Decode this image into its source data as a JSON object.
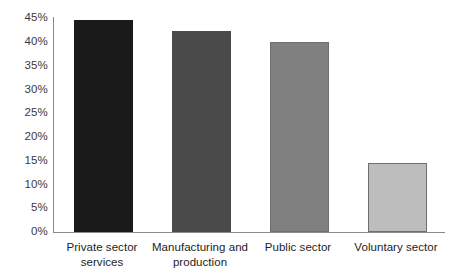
{
  "chart_data": {
    "type": "bar",
    "title": "",
    "subtitle": "",
    "xlabel": "",
    "ylabel": "",
    "ylim": [
      0,
      45
    ],
    "grid": false,
    "legend": "none",
    "categories": [
      "Private sector services",
      "Manufacturing and production",
      "Public sector",
      "Voluntary sector"
    ],
    "category_lines": [
      [
        "Private sector",
        "services"
      ],
      [
        "Manufacturing and",
        "production"
      ],
      [
        "Public sector"
      ],
      [
        "Voluntary sector"
      ]
    ],
    "values": [
      44.7,
      42.3,
      40.0,
      14.5
    ],
    "value_labels": [
      "44.7%",
      "42.3%",
      "40.0%",
      "14.5%"
    ],
    "bar_colors": [
      "#1a1a1a",
      "#4a4a4a",
      "#808080",
      "#bdbdbd"
    ],
    "bar_border_colors": [
      "#1a1a1a",
      "#4a4a4a",
      "#6f6f6f",
      "#6f6f6f"
    ],
    "y_ticks": [
      0,
      5,
      10,
      15,
      20,
      25,
      30,
      35,
      40,
      45
    ],
    "y_tick_labels": [
      "0%",
      "5%",
      "10%",
      "15%",
      "20%",
      "25%",
      "30%",
      "35%",
      "40%",
      "45%"
    ],
    "axis_color": "#8a8a8a",
    "tick_label_color": "#3a3a3a",
    "category_label_color": "#1d1d1d",
    "background_color": "#ffffff"
  }
}
